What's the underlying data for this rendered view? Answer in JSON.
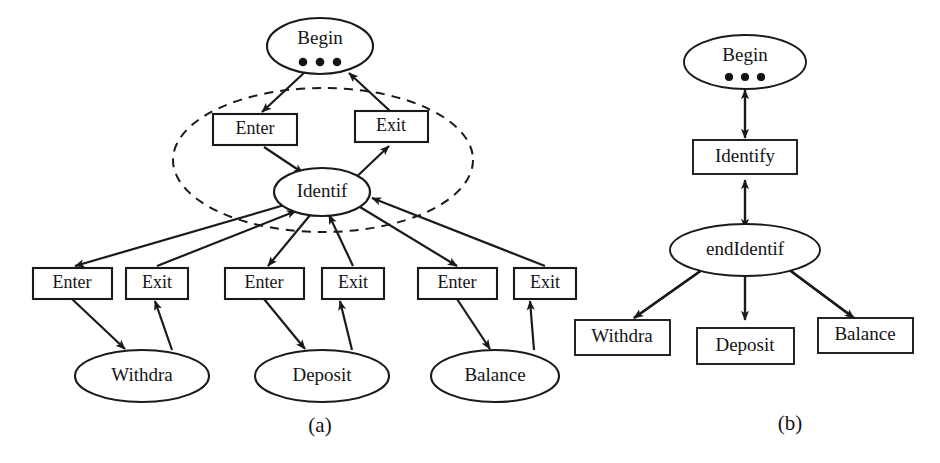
{
  "figure": {
    "background_color": "#ffffff",
    "line_color": "#1a1a1a",
    "text_color": "#141414",
    "captions": {
      "left": "(a)",
      "right": "(b)"
    }
  },
  "panel_a": {
    "caption": "(a)",
    "begin_node": {
      "label": "Begin",
      "shape": "ellipse",
      "ellipsis_dots": 3
    },
    "identify_node": {
      "label": "Identif",
      "shape": "ellipse"
    },
    "group_boundary": {
      "shape": "dashed-ellipse",
      "contains": [
        "Enter",
        "Exit",
        "Identif"
      ]
    },
    "middle_boxes": [
      {
        "label": "Enter",
        "shape": "rect"
      },
      {
        "label": "Exit",
        "shape": "rect"
      }
    ],
    "lower_boxes": [
      {
        "label": "Enter",
        "shape": "rect"
      },
      {
        "label": "Exit",
        "shape": "rect"
      },
      {
        "label": "Enter",
        "shape": "rect"
      },
      {
        "label": "Exit",
        "shape": "rect"
      },
      {
        "label": "Enter",
        "shape": "rect"
      },
      {
        "label": "Exit",
        "shape": "rect"
      }
    ],
    "leaf_nodes": [
      {
        "label": "Withdra",
        "shape": "ellipse"
      },
      {
        "label": "Deposit",
        "shape": "ellipse"
      },
      {
        "label": "Balance",
        "shape": "ellipse"
      }
    ]
  },
  "panel_b": {
    "caption": "(b)",
    "begin_node": {
      "label": "Begin",
      "shape": "ellipse",
      "ellipsis_dots": 3
    },
    "identify_node": {
      "label": "Identify",
      "shape": "rect"
    },
    "end_identify_node": {
      "label": "endIdentif",
      "shape": "ellipse"
    },
    "leaf_boxes": [
      {
        "label": "Withdra",
        "shape": "rect"
      },
      {
        "label": "Deposit",
        "shape": "rect"
      },
      {
        "label": "Balance",
        "shape": "rect"
      }
    ]
  }
}
